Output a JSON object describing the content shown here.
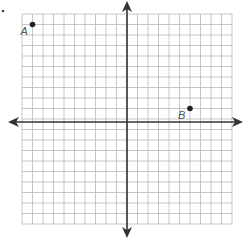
{
  "diagram": {
    "type": "coordinate-plane",
    "grid": {
      "x_min": -10,
      "x_max": 10,
      "y_min": -10,
      "y_max": 10,
      "step": 1
    },
    "axes": {
      "x_arrows": true,
      "y_arrows": true
    },
    "colors": {
      "grid": "#b8b8b8",
      "axis": "#333333",
      "point": "#222222",
      "label": "#555555"
    },
    "points": [
      {
        "label": "A",
        "x": -9,
        "y": 9
      },
      {
        "label": "B",
        "x": 6,
        "y": 1
      }
    ]
  }
}
